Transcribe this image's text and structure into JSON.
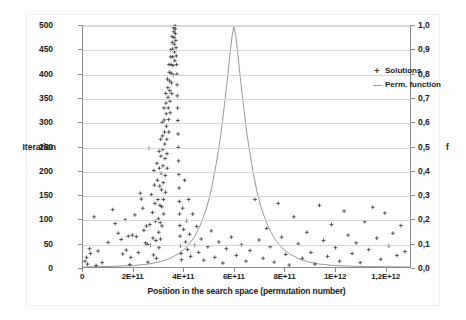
{
  "chart_data": {
    "type": "scatter",
    "title": "",
    "xlabel": "Position in the search space (permutation number)",
    "ylabel": "Iteration",
    "y2label": "f",
    "xlim": [
      0,
      1300000000000
    ],
    "ylim": [
      0,
      500
    ],
    "y2lim": [
      0,
      1.0
    ],
    "grid": true,
    "legend_position": "top-right-inside",
    "xticks": [
      {
        "value": 0,
        "label": "0"
      },
      {
        "value": 200000000000,
        "label": "2E+11"
      },
      {
        "value": 400000000000,
        "label": "4E+11"
      },
      {
        "value": 600000000000,
        "label": "6E+11"
      },
      {
        "value": 800000000000,
        "label": "8E+11"
      },
      {
        "value": 1000000000000,
        "label": "1E+12"
      },
      {
        "value": 1200000000000,
        "label": "1,2E+12"
      }
    ],
    "yticks": [
      {
        "value": 0,
        "label": "0"
      },
      {
        "value": 50,
        "label": "50"
      },
      {
        "value": 100,
        "label": "100"
      },
      {
        "value": 150,
        "label": "150"
      },
      {
        "value": 200,
        "label": "200"
      },
      {
        "value": 250,
        "label": "250"
      },
      {
        "value": 300,
        "label": "300"
      },
      {
        "value": 350,
        "label": "350"
      },
      {
        "value": 400,
        "label": "400"
      },
      {
        "value": 450,
        "label": "450"
      },
      {
        "value": 500,
        "label": "500"
      }
    ],
    "y2ticks": [
      {
        "value": 0.0,
        "label": "0,0"
      },
      {
        "value": 0.1,
        "label": "0,1"
      },
      {
        "value": 0.2,
        "label": "0,2"
      },
      {
        "value": 0.3,
        "label": "0,3"
      },
      {
        "value": 0.4,
        "label": "0,4"
      },
      {
        "value": 0.5,
        "label": "0,5"
      },
      {
        "value": 0.6,
        "label": "0,6"
      },
      {
        "value": 0.7,
        "label": "0,7"
      },
      {
        "value": 0.8,
        "label": "0,8"
      },
      {
        "value": 0.9,
        "label": "0,9"
      },
      {
        "value": 1.0,
        "label": "1,0"
      }
    ],
    "legend": [
      {
        "name": "Solutions",
        "marker": "+",
        "color": "#333333",
        "axis": "left"
      },
      {
        "name": "Perm. function",
        "marker": "line",
        "color": "#8c8c8c",
        "axis": "right"
      }
    ],
    "series": [
      {
        "name": "Solutions",
        "type": "scatter",
        "axis": "left",
        "marker": "+",
        "color": "#333333",
        "points": [
          [
            8000000000,
            12
          ],
          [
            14000000000,
            20
          ],
          [
            18000000000,
            6
          ],
          [
            26000000000,
            38
          ],
          [
            30000000000,
            28
          ],
          [
            44000000000,
            104
          ],
          [
            52000000000,
            3
          ],
          [
            60000000000,
            33
          ],
          [
            76000000000,
            9
          ],
          [
            100000000000,
            51
          ],
          [
            118000000000,
            119
          ],
          [
            128000000000,
            90
          ],
          [
            140000000000,
            70
          ],
          [
            152000000000,
            57
          ],
          [
            158000000000,
            27
          ],
          [
            168000000000,
            98
          ],
          [
            172000000000,
            35
          ],
          [
            180000000000,
            64
          ],
          [
            186000000000,
            5
          ],
          [
            190000000000,
            20
          ],
          [
            196000000000,
            66
          ],
          [
            206000000000,
            108
          ],
          [
            212000000000,
            63
          ],
          [
            220000000000,
            30
          ],
          [
            228000000000,
            153
          ],
          [
            232000000000,
            141
          ],
          [
            238000000000,
            122
          ],
          [
            242000000000,
            76
          ],
          [
            248000000000,
            50
          ],
          [
            252000000000,
            85
          ],
          [
            256000000000,
            47
          ],
          [
            258000000000,
            10
          ],
          [
            262000000000,
            246
          ],
          [
            266000000000,
            88
          ],
          [
            268000000000,
            45
          ],
          [
            272000000000,
            150
          ],
          [
            276000000000,
            113
          ],
          [
            278000000000,
            60
          ],
          [
            280000000000,
            25
          ],
          [
            282000000000,
            200
          ],
          [
            284000000000,
            170
          ],
          [
            286000000000,
            132
          ],
          [
            288000000000,
            95
          ],
          [
            290000000000,
            55
          ],
          [
            292000000000,
            18
          ],
          [
            294000000000,
            215
          ],
          [
            296000000000,
            180
          ],
          [
            298000000000,
            140
          ],
          [
            300000000000,
            100
          ],
          [
            301000000000,
            72
          ],
          [
            302000000000,
            40
          ],
          [
            303000000000,
            240
          ],
          [
            304000000000,
            205
          ],
          [
            305000000000,
            168
          ],
          [
            306000000000,
            128
          ],
          [
            307000000000,
            92
          ],
          [
            308000000000,
            58
          ],
          [
            309000000000,
            265
          ],
          [
            310000000000,
            230
          ],
          [
            311000000000,
            195
          ],
          [
            312000000000,
            160
          ],
          [
            313000000000,
            125
          ],
          [
            314000000000,
            85
          ],
          [
            315000000000,
            300
          ],
          [
            316000000000,
            272
          ],
          [
            317000000000,
            244
          ],
          [
            318000000000,
            210
          ],
          [
            319000000000,
            175
          ],
          [
            320000000000,
            140
          ],
          [
            321000000000,
            110
          ],
          [
            322000000000,
            330
          ],
          [
            323000000000,
            305
          ],
          [
            324000000000,
            280
          ],
          [
            325000000000,
            255
          ],
          [
            326000000000,
            225
          ],
          [
            327000000000,
            190
          ],
          [
            328000000000,
            155
          ],
          [
            329000000000,
            360
          ],
          [
            330000000000,
            340
          ],
          [
            331000000000,
            318
          ],
          [
            332000000000,
            292
          ],
          [
            333000000000,
            265
          ],
          [
            334000000000,
            235
          ],
          [
            335000000000,
            205
          ],
          [
            336000000000,
            390
          ],
          [
            337000000000,
            372
          ],
          [
            338000000000,
            352
          ],
          [
            339000000000,
            330
          ],
          [
            340000000000,
            306
          ],
          [
            341000000000,
            280
          ],
          [
            342000000000,
            420
          ],
          [
            343000000000,
            404
          ],
          [
            344000000000,
            386
          ],
          [
            345000000000,
            366
          ],
          [
            346000000000,
            344
          ],
          [
            347000000000,
            320
          ],
          [
            348000000000,
            450
          ],
          [
            349000000000,
            436
          ],
          [
            350000000000,
            420
          ],
          [
            351000000000,
            402
          ],
          [
            352000000000,
            382
          ],
          [
            353000000000,
            360
          ],
          [
            354000000000,
            478
          ],
          [
            355000000000,
            466
          ],
          [
            356000000000,
            452
          ],
          [
            357000000000,
            436
          ],
          [
            358000000000,
            418
          ],
          [
            359000000000,
            398
          ],
          [
            360000000000,
            496
          ],
          [
            361000000000,
            488
          ],
          [
            362000000000,
            476
          ],
          [
            363000000000,
            462
          ],
          [
            364000000000,
            446
          ],
          [
            365000000000,
            428
          ],
          [
            366000000000,
            500
          ],
          [
            367000000000,
            494
          ],
          [
            368000000000,
            484
          ],
          [
            369000000000,
            470
          ],
          [
            370000000000,
            455
          ],
          [
            371000000000,
            438
          ],
          [
            372000000000,
            420
          ],
          [
            373000000000,
            400
          ],
          [
            374000000000,
            378
          ],
          [
            375000000000,
            355
          ],
          [
            376000000000,
            330
          ],
          [
            377000000000,
            304
          ],
          [
            378000000000,
            276
          ],
          [
            379000000000,
            248
          ],
          [
            380000000000,
            220
          ],
          [
            381000000000,
            192
          ],
          [
            382000000000,
            164
          ],
          [
            383000000000,
            136
          ],
          [
            384000000000,
            110
          ],
          [
            385000000000,
            86
          ],
          [
            386000000000,
            64
          ],
          [
            388000000000,
            44
          ],
          [
            390000000000,
            28
          ],
          [
            392000000000,
            15
          ],
          [
            396000000000,
            122
          ],
          [
            400000000000,
            78
          ],
          [
            404000000000,
            180
          ],
          [
            408000000000,
            52
          ],
          [
            412000000000,
            96
          ],
          [
            416000000000,
            36
          ],
          [
            420000000000,
            140
          ],
          [
            424000000000,
            68
          ],
          [
            428000000000,
            22
          ],
          [
            436000000000,
            110
          ],
          [
            444000000000,
            45
          ],
          [
            452000000000,
            84
          ],
          [
            460000000000,
            30
          ],
          [
            470000000000,
            58
          ],
          [
            480000000000,
            14
          ],
          [
            496000000000,
            42
          ],
          [
            510000000000,
            75
          ],
          [
            524000000000,
            20
          ],
          [
            540000000000,
            52
          ],
          [
            556000000000,
            8
          ],
          [
            570000000000,
            38
          ],
          [
            590000000000,
            62
          ],
          [
            610000000000,
            24
          ],
          [
            630000000000,
            46
          ],
          [
            648000000000,
            12
          ],
          [
            664000000000,
            34
          ],
          [
            684000000000,
            140
          ],
          [
            700000000000,
            56
          ],
          [
            716000000000,
            18
          ],
          [
            730000000000,
            80
          ],
          [
            744000000000,
            42
          ],
          [
            760000000000,
            10
          ],
          [
            776000000000,
            132
          ],
          [
            790000000000,
            62
          ],
          [
            806000000000,
            26
          ],
          [
            820000000000,
            4
          ],
          [
            838000000000,
            104
          ],
          [
            856000000000,
            48
          ],
          [
            872000000000,
            18
          ],
          [
            890000000000,
            72
          ],
          [
            906000000000,
            30
          ],
          [
            922000000000,
            6
          ],
          [
            940000000000,
            128
          ],
          [
            956000000000,
            55
          ],
          [
            972000000000,
            22
          ],
          [
            988000000000,
            88
          ],
          [
            1004000000000,
            40
          ],
          [
            1020000000000,
            12
          ],
          [
            1038000000000,
            116
          ],
          [
            1054000000000,
            66
          ],
          [
            1070000000000,
            28
          ],
          [
            1086000000000,
            50
          ],
          [
            1102000000000,
            9
          ],
          [
            1120000000000,
            94
          ],
          [
            1136000000000,
            36
          ],
          [
            1152000000000,
            124
          ],
          [
            1168000000000,
            60
          ],
          [
            1184000000000,
            16
          ],
          [
            1200000000000,
            112
          ],
          [
            1216000000000,
            44
          ],
          [
            1232000000000,
            70
          ],
          [
            1248000000000,
            24
          ],
          [
            1264000000000,
            86
          ],
          [
            1280000000000,
            32
          ]
        ]
      },
      {
        "name": "Perm. function",
        "type": "line",
        "axis": "right",
        "color": "#8c8c8c",
        "peak_x": 600000000000,
        "peak_f": 1.0,
        "points": [
          [
            0,
            0.0
          ],
          [
            100000000000,
            0.002
          ],
          [
            200000000000,
            0.006
          ],
          [
            260000000000,
            0.012
          ],
          [
            300000000000,
            0.02
          ],
          [
            340000000000,
            0.033
          ],
          [
            380000000000,
            0.055
          ],
          [
            410000000000,
            0.08
          ],
          [
            440000000000,
            0.12
          ],
          [
            465000000000,
            0.17
          ],
          [
            490000000000,
            0.24
          ],
          [
            510000000000,
            0.32
          ],
          [
            530000000000,
            0.43
          ],
          [
            548000000000,
            0.55
          ],
          [
            562000000000,
            0.67
          ],
          [
            575000000000,
            0.79
          ],
          [
            585000000000,
            0.89
          ],
          [
            593000000000,
            0.96
          ],
          [
            600000000000,
            1.0
          ],
          [
            607000000000,
            0.96
          ],
          [
            615000000000,
            0.89
          ],
          [
            625000000000,
            0.79
          ],
          [
            638000000000,
            0.67
          ],
          [
            652000000000,
            0.55
          ],
          [
            670000000000,
            0.43
          ],
          [
            690000000000,
            0.32
          ],
          [
            710000000000,
            0.24
          ],
          [
            735000000000,
            0.17
          ],
          [
            760000000000,
            0.12
          ],
          [
            790000000000,
            0.08
          ],
          [
            820000000000,
            0.055
          ],
          [
            860000000000,
            0.033
          ],
          [
            900000000000,
            0.02
          ],
          [
            940000000000,
            0.012
          ],
          [
            1000000000000,
            0.006
          ],
          [
            1100000000000,
            0.002
          ],
          [
            1300000000000,
            0.0
          ]
        ]
      }
    ]
  }
}
